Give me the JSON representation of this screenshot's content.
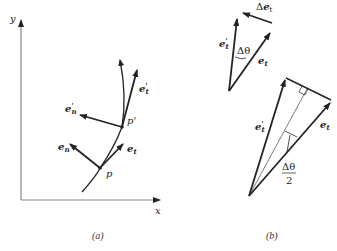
{
  "figure": {
    "panel_a": {
      "caption": "(a)",
      "axes": {
        "x_label": "x",
        "y_label": "y"
      },
      "points": [
        {
          "name": "p",
          "label": "p"
        },
        {
          "name": "p_prime",
          "label": "p'"
        }
      ],
      "vectors": {
        "e_t": {
          "base": "e",
          "sub": "t",
          "prime": ""
        },
        "e_n": {
          "base": "e",
          "sub": "n",
          "prime": ""
        },
        "e_t_prime": {
          "base": "e",
          "sub": "t",
          "prime": "'"
        },
        "e_n_prime": {
          "base": "e",
          "sub": "n",
          "prime": "'"
        }
      }
    },
    "panel_b": {
      "caption": "(b)",
      "top": {
        "delta_e": {
          "prefix": "Δ",
          "base": "e",
          "sub": "t"
        },
        "e_t_prime": {
          "base": "e",
          "sub": "t",
          "prime": "'"
        },
        "e_t": {
          "base": "e",
          "sub": "t"
        },
        "angle": "Δθ"
      },
      "bottom": {
        "e_t_prime": {
          "base": "e",
          "sub": "t",
          "prime": "'"
        },
        "e_t": {
          "base": "e",
          "sub": "t"
        },
        "half_angle_num": "Δθ",
        "half_angle_den": "2"
      }
    }
  },
  "colors": {
    "ink": "#222222",
    "axis": "#888888"
  }
}
